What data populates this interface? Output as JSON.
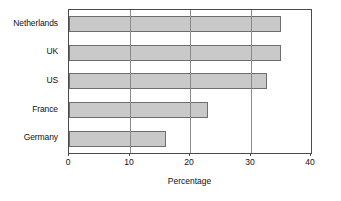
{
  "chart_data": {
    "type": "bar",
    "orientation": "horizontal",
    "title": "",
    "xlabel": "Percentage",
    "ylabel": "",
    "categories": [
      "Netherlands",
      "UK",
      "US",
      "France",
      "Germany"
    ],
    "values": [
      35,
      35,
      32.7,
      23,
      16
    ],
    "xlim": [
      0,
      40
    ],
    "xticks": [
      0,
      10,
      20,
      30,
      40
    ],
    "xtick_labels": [
      "0",
      "10",
      "20",
      "30",
      "40"
    ],
    "grid": "vertical",
    "legend": "none",
    "series": [
      {
        "name": "Percentage",
        "values": [
          35,
          35,
          32.7,
          23,
          16
        ]
      }
    ],
    "colors": {
      "bar_fill": "#c9c9c9",
      "bar_border": "#6e6e6e",
      "gridline": "#8a8a8a",
      "axis": "#4a4a4a",
      "text": "#111111",
      "background": "#ffffff"
    }
  }
}
